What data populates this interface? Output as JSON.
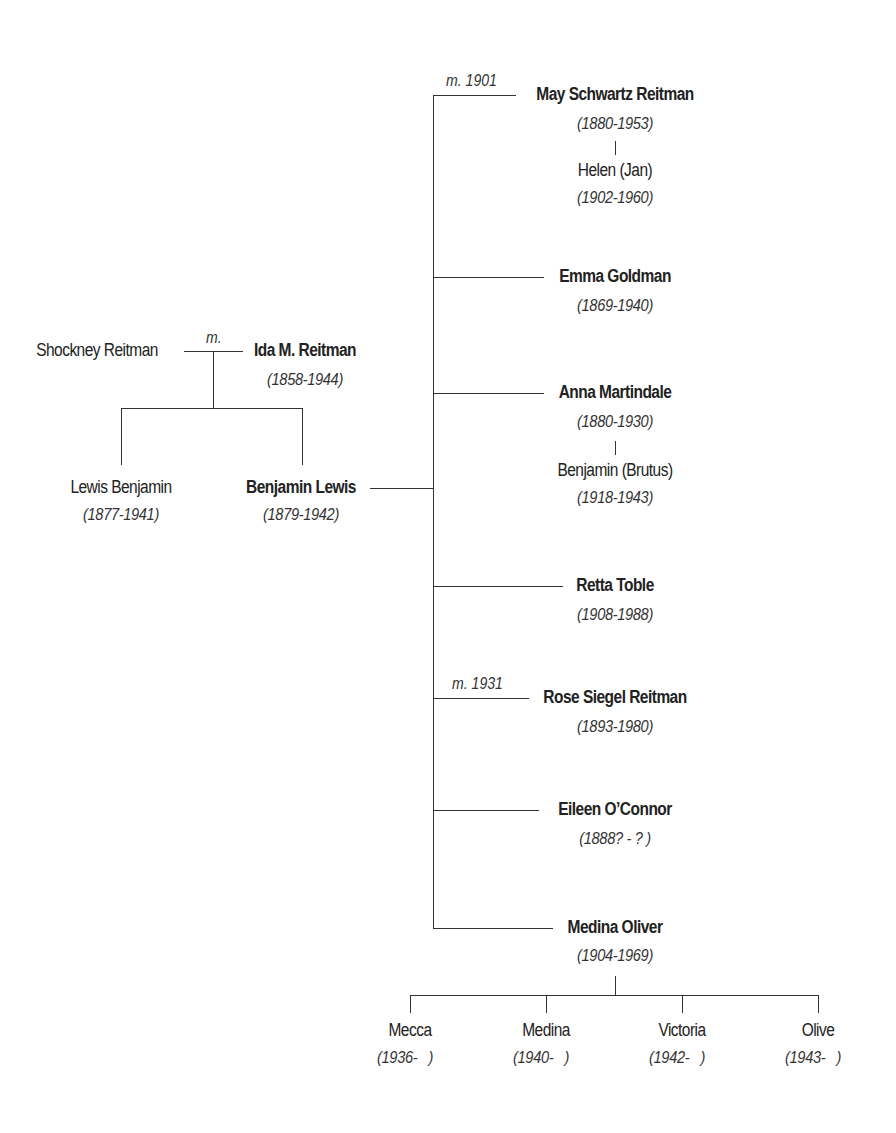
{
  "parents": {
    "father": {
      "name": "Shockney Reitman"
    },
    "mother": {
      "name": "Ida M. Reitman",
      "dates": "(1858-1944)"
    },
    "marriage_label": "m."
  },
  "siblings": [
    {
      "name": "Lewis Benjamin",
      "dates": "(1877-1941)",
      "bold": false
    },
    {
      "name": "Benjamin Lewis",
      "dates": "(1879-1942)",
      "bold": true
    }
  ],
  "partners": [
    {
      "name": "May Schwartz Reitman",
      "dates": "(1880-1953)",
      "marriage": "m. 1901",
      "children": [
        {
          "name": "Helen (Jan)",
          "dates": "(1902-1960)"
        }
      ]
    },
    {
      "name": "Emma Goldman",
      "dates": "(1869-1940)"
    },
    {
      "name": "Anna Martindale",
      "dates": "(1880-1930)",
      "children": [
        {
          "name": "Benjamin (Brutus)",
          "dates": "(1918-1943)"
        }
      ]
    },
    {
      "name": "Retta Toble",
      "dates": "(1908-1988)"
    },
    {
      "name": "Rose Siegel Reitman",
      "dates": "(1893-1980)",
      "marriage": "m. 1931"
    },
    {
      "name": "Eileen O’Connor",
      "dates": "(1888? - ? )"
    },
    {
      "name": "Medina Oliver",
      "dates": "(1904-1969)",
      "children": [
        {
          "name": "Mecca",
          "dates": "(1936-   )"
        },
        {
          "name": "Medina",
          "dates": "(1940-   )"
        },
        {
          "name": "Victoria",
          "dates": "(1942-   )"
        },
        {
          "name": "Olive",
          "dates": "(1943-   )"
        }
      ]
    }
  ]
}
